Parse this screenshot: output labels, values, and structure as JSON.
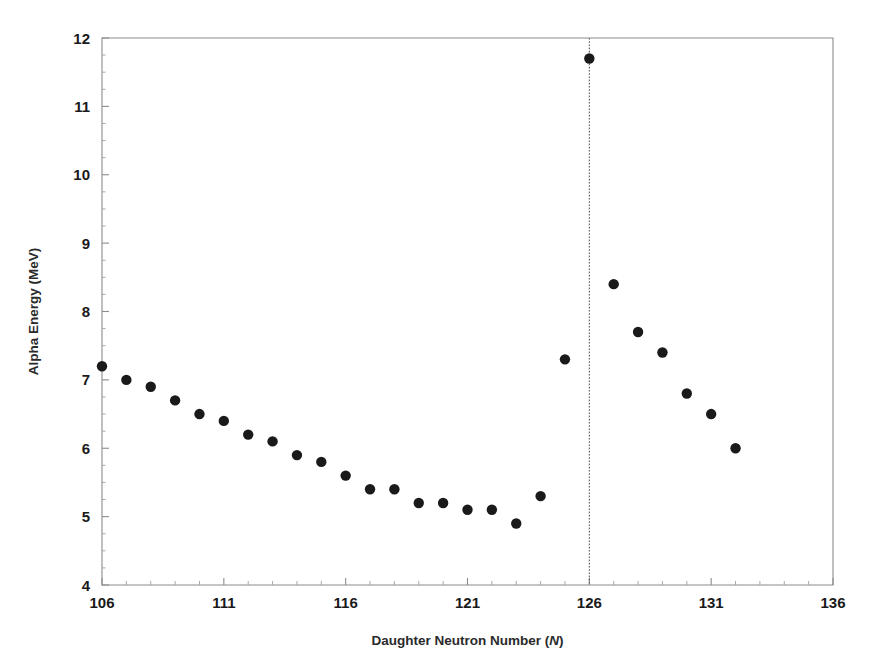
{
  "chart_data": {
    "type": "scatter",
    "title": "",
    "xlabel": "Daughter Neutron Number (N)",
    "xlabel_prefix": "Daughter Neutron Number (",
    "xlabel_italic": "N",
    "xlabel_suffix": ")",
    "ylabel": "Alpha Energy (MeV)",
    "xlim": [
      106,
      136
    ],
    "ylim": [
      4,
      12
    ],
    "x_major_ticks": [
      106,
      111,
      116,
      121,
      126,
      131,
      136
    ],
    "x_tick_labels": [
      "106",
      "111",
      "116",
      "121",
      "126",
      "131",
      "136"
    ],
    "x_minor_step": 1,
    "y_major_ticks": [
      4,
      5,
      6,
      7,
      8,
      9,
      10,
      11,
      12
    ],
    "y_tick_labels": [
      "4",
      "5",
      "6",
      "7",
      "8",
      "9",
      "10",
      "11",
      "12"
    ],
    "grid": false,
    "legend": false,
    "marker_color": "#1a1a1a",
    "marker_size": 5.2,
    "annotations": [
      {
        "name": "magic-number-line",
        "type": "vline",
        "x": 126,
        "style": "dotted",
        "color": "#555555"
      }
    ],
    "x": [
      106,
      107,
      108,
      109,
      110,
      111,
      112,
      113,
      114,
      115,
      116,
      117,
      118,
      119,
      120,
      121,
      122,
      123,
      124,
      125,
      126,
      127,
      128,
      129,
      130,
      131,
      132
    ],
    "y": [
      7.2,
      7.0,
      6.9,
      6.7,
      6.5,
      6.4,
      6.2,
      6.1,
      5.9,
      5.8,
      5.6,
      5.4,
      5.4,
      5.2,
      5.2,
      5.1,
      5.1,
      4.9,
      5.3,
      7.3,
      11.7,
      8.4,
      7.7,
      7.4,
      6.8,
      6.5,
      6.0
    ],
    "points": [
      {
        "x": 106,
        "y": 7.2
      },
      {
        "x": 107,
        "y": 7.0
      },
      {
        "x": 108,
        "y": 6.9
      },
      {
        "x": 109,
        "y": 6.7
      },
      {
        "x": 110,
        "y": 6.5
      },
      {
        "x": 111,
        "y": 6.4
      },
      {
        "x": 112,
        "y": 6.2
      },
      {
        "x": 113,
        "y": 6.1
      },
      {
        "x": 114,
        "y": 5.9
      },
      {
        "x": 115,
        "y": 5.8
      },
      {
        "x": 116,
        "y": 5.6
      },
      {
        "x": 117,
        "y": 5.4
      },
      {
        "x": 118,
        "y": 5.4
      },
      {
        "x": 119,
        "y": 5.2
      },
      {
        "x": 120,
        "y": 5.2
      },
      {
        "x": 121,
        "y": 5.1
      },
      {
        "x": 122,
        "y": 5.1
      },
      {
        "x": 123,
        "y": 4.9
      },
      {
        "x": 124,
        "y": 5.3
      },
      {
        "x": 125,
        "y": 7.3
      },
      {
        "x": 126,
        "y": 11.7
      },
      {
        "x": 127,
        "y": 8.4
      },
      {
        "x": 128,
        "y": 7.7
      },
      {
        "x": 129,
        "y": 7.4
      },
      {
        "x": 130,
        "y": 6.8
      },
      {
        "x": 131,
        "y": 6.5
      },
      {
        "x": 132,
        "y": 6.0
      }
    ]
  },
  "figure": {
    "background_color": "#ffffff",
    "axis_color": "#8c8c8c",
    "text_color": "#1a1a1a"
  }
}
